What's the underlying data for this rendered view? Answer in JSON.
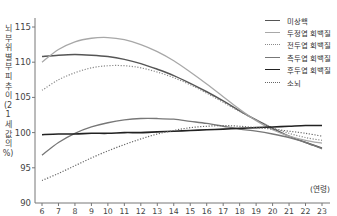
{
  "chart_data": {
    "type": "line",
    "title": "",
    "xlabel": "(연령)",
    "ylabel": "뇌 부위별 부피 추이 (21세 값의 %)",
    "xlim": [
      6,
      23
    ],
    "ylim": [
      90,
      115
    ],
    "grid": false,
    "legend_position": "top-right",
    "x": [
      6,
      7,
      8,
      9,
      10,
      11,
      12,
      13,
      14,
      15,
      16,
      17,
      18,
      19,
      20,
      21,
      22,
      23
    ],
    "x_tick_labels": [
      "6",
      "7",
      "8",
      "9",
      "10",
      "11",
      "12",
      "13",
      "14",
      "15",
      "16",
      "17",
      "18",
      "19",
      "20",
      "21",
      "22",
      "23"
    ],
    "y_tick_labels": [
      "90",
      "95",
      "100",
      "105",
      "110",
      "115"
    ],
    "series": [
      {
        "name": "미상핵",
        "style": "solid",
        "color": "#555555",
        "width": 1.5,
        "values": [
          110.8,
          111.0,
          111.1,
          111.0,
          110.8,
          110.4,
          109.8,
          109.0,
          108.1,
          107.0,
          105.8,
          104.5,
          103.1,
          101.8,
          100.6,
          99.5,
          98.6,
          97.8
        ]
      },
      {
        "name": "두정엽 회백질",
        "style": "solid",
        "color": "#a8a8a8",
        "width": 1.3,
        "values": [
          110.0,
          111.8,
          112.9,
          113.4,
          113.5,
          113.2,
          112.5,
          111.5,
          110.2,
          108.6,
          106.9,
          105.1,
          103.3,
          101.7,
          100.4,
          99.5,
          98.9,
          98.5
        ]
      },
      {
        "name": "전두엽 회백질",
        "style": "dotted",
        "color": "#8a8a8a",
        "width": 1.2,
        "values": [
          106.0,
          107.5,
          108.5,
          109.2,
          109.5,
          109.5,
          109.2,
          108.6,
          107.8,
          106.8,
          105.6,
          104.3,
          103.0,
          101.8,
          100.7,
          99.9,
          99.3,
          98.9
        ]
      },
      {
        "name": "측두엽 회백질",
        "style": "solid",
        "color": "#777777",
        "width": 1.3,
        "values": [
          96.8,
          98.6,
          99.9,
          100.8,
          101.4,
          101.8,
          102.0,
          102.0,
          101.9,
          101.6,
          101.3,
          100.9,
          100.5,
          100.2,
          99.8,
          99.3,
          98.6,
          97.7
        ]
      },
      {
        "name": "후두엽 회백질",
        "style": "solid",
        "color": "#222222",
        "width": 1.6,
        "values": [
          99.7,
          99.8,
          99.8,
          99.9,
          99.9,
          100.0,
          100.0,
          100.1,
          100.2,
          100.3,
          100.4,
          100.5,
          100.6,
          100.7,
          100.8,
          100.9,
          101.0,
          101.0
        ]
      },
      {
        "name": "소뇌",
        "style": "dotted",
        "color": "#666666",
        "width": 1.2,
        "values": [
          93.2,
          94.2,
          95.3,
          96.4,
          97.4,
          98.3,
          99.1,
          99.8,
          100.3,
          100.7,
          100.9,
          101.0,
          100.9,
          100.7,
          100.5,
          100.2,
          99.9,
          99.5
        ]
      }
    ]
  }
}
